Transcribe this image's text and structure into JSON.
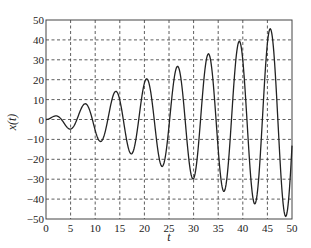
{
  "chart_data": {
    "type": "line",
    "title": "",
    "xlabel": "t",
    "ylabel": "x(t)",
    "xlim": [
      0,
      50
    ],
    "ylim": [
      -50,
      50
    ],
    "xticks": [
      0,
      5,
      10,
      15,
      20,
      25,
      30,
      35,
      40,
      45,
      50
    ],
    "yticks": [
      -50,
      -40,
      -30,
      -20,
      -10,
      0,
      10,
      20,
      30,
      40,
      50
    ],
    "grid": true,
    "legend": null,
    "series": [
      {
        "name": "x(t)",
        "color": "#222222",
        "x": [
          0,
          1,
          2,
          3,
          4,
          4.9,
          6,
          7,
          8,
          9,
          10,
          11,
          12,
          13,
          14,
          15,
          16,
          17.3,
          18,
          19,
          20.1,
          21,
          22,
          23.5,
          25,
          26.7,
          28,
          29.9,
          31,
          33,
          35,
          36.2,
          37,
          39.2,
          41,
          42.3,
          44,
          45.5,
          47,
          48.6,
          50
        ],
        "values": [
          0,
          0.84,
          1.82,
          0.42,
          -3.03,
          -4.81,
          -1.68,
          4.6,
          7.91,
          3.71,
          -5.44,
          -11.0,
          -6.44,
          5.46,
          13.87,
          9.75,
          -4.61,
          -17.19,
          -13.52,
          2.85,
          19.99,
          17.57,
          -0.2,
          -22.47,
          -3.3,
          26.22,
          7.67,
          -29.26,
          -12.99,
          32.97,
          -15.6,
          -35.44,
          -23.72,
          39.0,
          -6.52,
          -42.04,
          0.35,
          45.2,
          5.86,
          -48.35,
          -13.12
        ]
      }
    ],
    "formula_hint": "x(t) ≈ t·sin(t)"
  }
}
